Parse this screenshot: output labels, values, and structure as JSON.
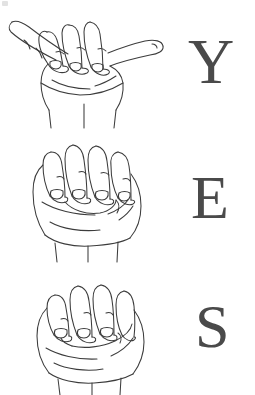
{
  "document": {
    "title": "YES",
    "description": "ASL fingerspelling chart spelling the word YES",
    "background_color": "#ffffff",
    "ink_color": "#3c3c3c",
    "letter_color": "#4a4a4a"
  },
  "rows": [
    {
      "letter": "Y",
      "hand_sign_name": "asl-letter-y-hand",
      "hand_description": "Open palm with thumb and pinky extended, three middle fingers curled down"
    },
    {
      "letter": "E",
      "hand_sign_name": "asl-letter-e-hand",
      "hand_description": "Fist with all four fingers curled down onto the tucked thumb"
    },
    {
      "letter": "S",
      "hand_sign_name": "asl-letter-s-hand",
      "hand_description": "Closed fist with thumb crossing in front of the curled fingers"
    }
  ]
}
